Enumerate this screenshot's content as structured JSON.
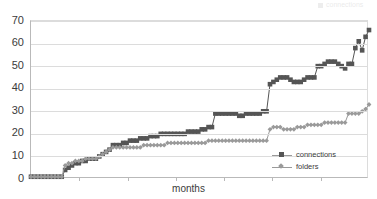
{
  "chart_data": {
    "type": "line",
    "title": "",
    "subtitle": "",
    "xlabel": "months",
    "ylabel": "",
    "ylim": [
      0,
      70
    ],
    "ytick_labels": [
      "70",
      "60",
      "50",
      "40",
      "30",
      "20",
      "10",
      "0"
    ],
    "ytick_values": [
      70,
      60,
      50,
      40,
      30,
      20,
      10,
      0
    ],
    "xtick_labels": [],
    "xtick_count": 6,
    "grid": true,
    "legend_position": "inside-bottom-right",
    "x": [
      0,
      1,
      2,
      3,
      4,
      5,
      6,
      7,
      8,
      9,
      10,
      11,
      12,
      13,
      14,
      15,
      16,
      17,
      18,
      19,
      20,
      21,
      22,
      23,
      24,
      25,
      26,
      27,
      28,
      29,
      30,
      31,
      32,
      33,
      34,
      35,
      36,
      37,
      38,
      39,
      40,
      41,
      42,
      43,
      44,
      45,
      46,
      47,
      48,
      49,
      50,
      51,
      52,
      53,
      54,
      55,
      56,
      57,
      58,
      59,
      60,
      61,
      62,
      63,
      64,
      65,
      66,
      67,
      68,
      69,
      70,
      71,
      72,
      73,
      74,
      75,
      76,
      77,
      78,
      79,
      80,
      81,
      82,
      83,
      84,
      85,
      86,
      87,
      88,
      89,
      90,
      91,
      92,
      93,
      94,
      95,
      96,
      97,
      98,
      99
    ],
    "series": [
      {
        "name": "connections",
        "color": "#555555",
        "marker": "square",
        "values": [
          1,
          1,
          1,
          1,
          1,
          1,
          1,
          1,
          1,
          1,
          4,
          5,
          6,
          7,
          7,
          8,
          8,
          9,
          9,
          9,
          10,
          11,
          12,
          13,
          15,
          15,
          15,
          16,
          16,
          17,
          17,
          17,
          18,
          18,
          18,
          19,
          19,
          19,
          20,
          20,
          20,
          20,
          20,
          20,
          20,
          20,
          21,
          21,
          21,
          21,
          22,
          22,
          23,
          23,
          29,
          29,
          29,
          29,
          29,
          29,
          29,
          28,
          28,
          29,
          29,
          29,
          29,
          29,
          30,
          30,
          42,
          43,
          44,
          45,
          45,
          45,
          44,
          43,
          43,
          43,
          44,
          45,
          45,
          45,
          50,
          50,
          51,
          52,
          52,
          52,
          51,
          50,
          49,
          51,
          51,
          58,
          61,
          57,
          63,
          66
        ]
      },
      {
        "name": "folders",
        "color": "#9a9a9a",
        "marker": "diamond",
        "values": [
          1,
          1,
          1,
          1,
          1,
          1,
          1,
          1,
          1,
          1,
          6,
          7,
          7,
          8,
          8,
          8,
          9,
          9,
          9,
          9,
          10,
          11,
          12,
          13,
          14,
          14,
          14,
          14,
          14,
          14,
          14,
          14,
          14,
          15,
          15,
          15,
          15,
          15,
          15,
          15,
          16,
          16,
          16,
          16,
          16,
          16,
          16,
          16,
          16,
          16,
          16,
          16,
          17,
          17,
          17,
          17,
          17,
          17,
          17,
          17,
          17,
          17,
          17,
          17,
          17,
          17,
          17,
          17,
          17,
          17,
          22,
          23,
          23,
          23,
          22,
          22,
          22,
          22,
          23,
          23,
          23,
          24,
          24,
          24,
          24,
          24,
          25,
          25,
          25,
          25,
          25,
          25,
          25,
          29,
          29,
          29,
          29,
          30,
          31,
          33
        ]
      }
    ]
  },
  "axis": {
    "x_label": "months"
  },
  "legend": {
    "items": [
      {
        "label": "connections",
        "marker": "square-marker",
        "color": "#555555"
      },
      {
        "label": "folders",
        "marker": "diamond-marker",
        "color": "#9a9a9a"
      }
    ]
  },
  "artifacts": {
    "top_right_fragment": "connections"
  }
}
